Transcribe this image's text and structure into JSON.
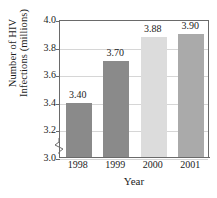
{
  "chart_data": {
    "type": "bar",
    "title": "",
    "categories": [
      "1998",
      "1999",
      "2000",
      "2001"
    ],
    "values": [
      3.4,
      3.7,
      3.88,
      3.9
    ],
    "data_labels": [
      "3.40",
      "3.70",
      "3.88",
      "3.90"
    ],
    "bar_colors": [
      "#8a8a8a",
      "#8a8a8a",
      "#dcdcdc",
      "#aaaaaa"
    ],
    "xlabel": "Year",
    "ylabel_line1": "Number of HIV",
    "ylabel_line2": "Infections (millions)",
    "ylim": [
      3.0,
      4.0
    ],
    "yticks": [
      "4.0",
      "3.8",
      "3.6",
      "3.4",
      "3.2",
      "3.0"
    ],
    "ytick_values": [
      4.0,
      3.8,
      3.6,
      3.4,
      3.2,
      3.0
    ],
    "grid": true,
    "legend": "none",
    "axis_break": true,
    "axis_break_note": "y-axis broken below 3.0"
  },
  "colors": {
    "axis": "#6a6a6a",
    "grid": "#d6d6d6",
    "text": "#1c1c1c",
    "background": "#ffffff"
  }
}
